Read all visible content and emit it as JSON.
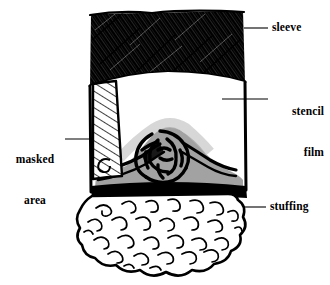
{
  "figure": {
    "kind": "hand-drawn-cross-section-diagram",
    "title": "",
    "background_color": "#ffffff",
    "ink_color": "#000000",
    "gray_tone_color": "#9a9a9a",
    "parts": {
      "sleeve": {
        "name": "sleeve",
        "fill": "black-diagonal-hatch",
        "region": "top band of the tube"
      },
      "stencil_film": {
        "name": "stencil film",
        "fill": "white",
        "region": "middle band of the tube"
      },
      "masked_area": {
        "name": "masked area",
        "fill": "white-with-diagonal-line-hatch",
        "region": "narrow vertical band on left side of stencil film"
      },
      "stuffing": {
        "name": "stuffing",
        "fill": "white-with-squiggle-curls",
        "region": "cloud shaped mass below the tube"
      },
      "knot": {
        "name": "tangled-knot",
        "fill": "thick black interlaced strands over gray mound"
      }
    }
  },
  "labels": [
    {
      "id": "sleeve",
      "lines": [
        "sleeve"
      ],
      "text": "sleeve",
      "side": "right",
      "leader": {
        "x1": 244,
        "y1": 28,
        "x2": 268,
        "y2": 28
      }
    },
    {
      "id": "stencil-film",
      "lines": [
        "stencil",
        "film"
      ],
      "line1": "stencil",
      "line2": "film",
      "side": "right",
      "leader": {
        "x1": 222,
        "y1": 99,
        "x2": 268,
        "y2": 99
      }
    },
    {
      "id": "masked-area",
      "lines": [
        "masked",
        "area"
      ],
      "line1": "masked",
      "line2": "area",
      "side": "left",
      "leader": {
        "x1": 65,
        "y1": 139,
        "x2": 102,
        "y2": 139
      }
    },
    {
      "id": "stuffing",
      "lines": [
        "stuffing"
      ],
      "text": "stuffing",
      "side": "right",
      "leader": {
        "x1": 243,
        "y1": 207,
        "x2": 266,
        "y2": 207
      }
    }
  ],
  "colors": {
    "ink": "#000000",
    "gray_shadow": "#9a9a9a",
    "gray_shadow_light": "#bdbdbd",
    "paper": "#ffffff"
  }
}
